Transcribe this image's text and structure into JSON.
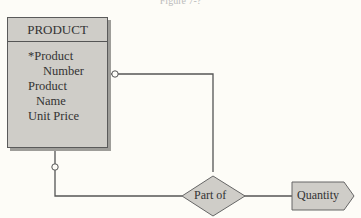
{
  "caption": "Figure 7-?",
  "entity": {
    "title": "PRODUCT",
    "attributes": [
      {
        "line1": "*Product",
        "line2": "Number"
      },
      {
        "line1": "Product",
        "line2": "Name"
      },
      {
        "line1": "Unit Price"
      }
    ]
  },
  "relationship": {
    "label": "Part of"
  },
  "attribute": {
    "label": "Quantity"
  }
}
